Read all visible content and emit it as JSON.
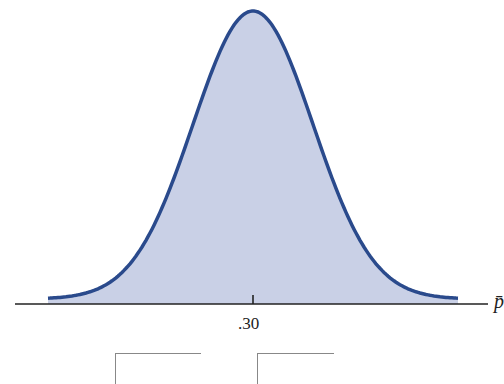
{
  "chart_data": {
    "type": "area",
    "title": "",
    "xlabel": "p̄",
    "ylabel": "",
    "x_ticks": [
      ".30"
    ],
    "mean": 0.3,
    "grid": false,
    "legend": null,
    "series": [
      {
        "name": "sampling distribution of p̄",
        "shape": "normal",
        "center": 0.3
      }
    ]
  },
  "colors": {
    "curve": "#2a4a8c",
    "fill": "#c9d0e6",
    "axis": "#222222"
  },
  "labels": {
    "tick_center": ".30",
    "axis_name": "p̄"
  }
}
